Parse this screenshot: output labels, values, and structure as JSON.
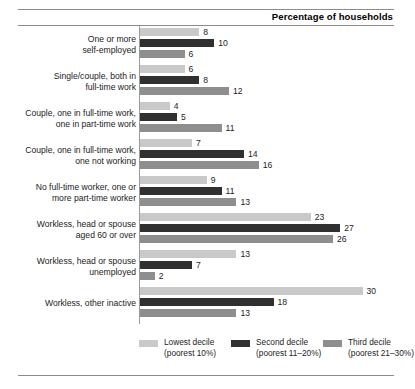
{
  "header": {
    "title": "Percentage of households"
  },
  "chart_data": {
    "type": "bar",
    "orientation": "horizontal",
    "title": "Percentage of households",
    "xlabel": "",
    "ylabel": "",
    "xlim": [
      0,
      30
    ],
    "grid": false,
    "legend_position": "bottom",
    "categories": [
      "One or more\nself-employed",
      "Single/couple, both in\nfull-time work",
      "Couple, one in full-time work,\none in part-time work",
      "Couple, one in full-time work,\none not working",
      "No full-time worker, one or\nmore part-time worker",
      "Workless, head or spouse\naged 60 or over",
      "Workless, head or spouse\nunemployed",
      "Workless, other inactive"
    ],
    "series": [
      {
        "name": "Lowest decile",
        "sub": "(poorest 10%)",
        "color": "#c9c9c9",
        "values": [
          8,
          6,
          4,
          7,
          9,
          23,
          13,
          30
        ]
      },
      {
        "name": "Second decile",
        "sub": "(poorest 11–20%)",
        "color": "#303030",
        "values": [
          10,
          8,
          5,
          14,
          11,
          27,
          7,
          18
        ]
      },
      {
        "name": "Third decile",
        "sub": "(poorest 21–30%)",
        "color": "#8e8e8e",
        "values": [
          6,
          12,
          11,
          16,
          13,
          26,
          2,
          13
        ]
      }
    ]
  }
}
